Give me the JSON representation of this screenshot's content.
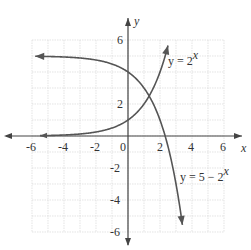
{
  "chart_data": {
    "type": "line",
    "title": "",
    "xlabel": "x",
    "ylabel": "y",
    "xlim": [
      -6,
      6
    ],
    "ylim": [
      -6,
      6
    ],
    "grid": true,
    "x_ticks": [
      "-6",
      "-4",
      "-2",
      "0",
      "2",
      "4",
      "6"
    ],
    "y_ticks": [
      "6",
      "2",
      "-2",
      "-4",
      "-6"
    ],
    "series": [
      {
        "name": "y = 2^x",
        "label_main": "y = 2",
        "label_sup": "x",
        "x": [
          -5.5,
          -4,
          -3,
          -2,
          -1,
          0,
          1,
          2,
          2.5
        ],
        "values": [
          0.02,
          0.06,
          0.13,
          0.25,
          0.5,
          1,
          2,
          4,
          5.66
        ]
      },
      {
        "name": "y = 5 - 2^x",
        "label_main": "y = 5 − 2",
        "label_sup": "x",
        "x": [
          -5.8,
          -4,
          -2,
          -1,
          0,
          1,
          2,
          2.32,
          3,
          3.4
        ],
        "values": [
          4.98,
          4.94,
          4.75,
          4.5,
          4,
          3,
          1,
          0,
          -3,
          -5.56
        ]
      }
    ]
  }
}
